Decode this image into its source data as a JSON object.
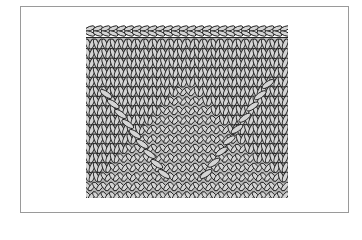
{
  "figure": {
    "colors": {
      "frame_border": "#9a9a9a",
      "stitch_fill": "#d4d4d4",
      "stitch_outline": "#222222",
      "background": "#ffffff"
    }
  }
}
